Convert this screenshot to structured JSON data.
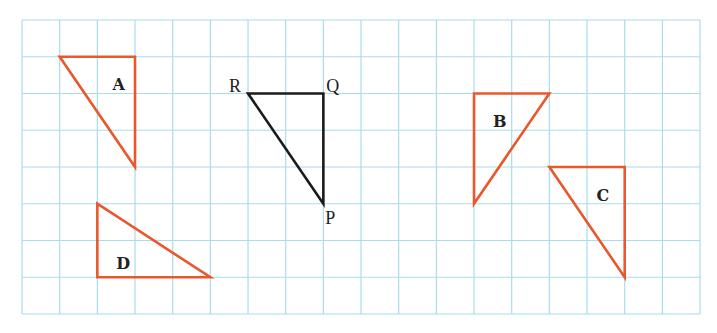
{
  "grid": {
    "origin_x": 22,
    "origin_y": 20,
    "cell_w": 37.67,
    "cell_h": 36.75,
    "cols": 18,
    "rows": 8,
    "line_color": "#a9dcec"
  },
  "colors": {
    "image_triangles": "#e9582b",
    "object_triangle": "#1b1b1b"
  },
  "object_triangle": {
    "name": "PQR",
    "vertices": [
      {
        "label": "R",
        "col": 6,
        "row": 2
      },
      {
        "label": "Q",
        "col": 8,
        "row": 2
      },
      {
        "label": "P",
        "col": 8,
        "row": 5
      }
    ]
  },
  "triangles": [
    {
      "label": "A",
      "points": [
        [
          1,
          1
        ],
        [
          3,
          1
        ],
        [
          3,
          4
        ]
      ],
      "label_pos": [
        2.4,
        1.75
      ]
    },
    {
      "label": "B",
      "points": [
        [
          12,
          2
        ],
        [
          14,
          2
        ],
        [
          12,
          5
        ]
      ],
      "label_pos": [
        12.5,
        2.75
      ]
    },
    {
      "label": "C",
      "points": [
        [
          14,
          4
        ],
        [
          16,
          4
        ],
        [
          16,
          7
        ]
      ],
      "label_pos": [
        15.25,
        4.75
      ]
    },
    {
      "label": "D",
      "points": [
        [
          2,
          5
        ],
        [
          2,
          7
        ],
        [
          5,
          7
        ]
      ],
      "label_pos": [
        2.5,
        6.6
      ]
    }
  ]
}
